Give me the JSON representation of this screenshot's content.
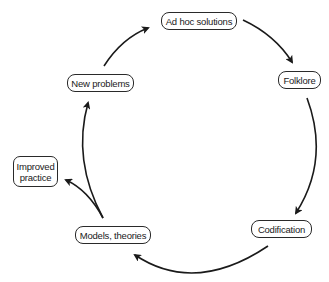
{
  "diagram": {
    "type": "cycle",
    "nodes": {
      "ad_hoc": {
        "label": "Ad hoc solutions"
      },
      "folklore": {
        "label": "Folklore"
      },
      "codification": {
        "label": "Codification"
      },
      "models": {
        "label": "Models, theories"
      },
      "new_problems": {
        "label": "New problems"
      },
      "improved": {
        "line1": "Improved",
        "line2": "practice"
      }
    },
    "edges": [
      {
        "from": "Ad hoc solutions",
        "to": "Folklore"
      },
      {
        "from": "Folklore",
        "to": "Codification"
      },
      {
        "from": "Codification",
        "to": "Models, theories"
      },
      {
        "from": "Models, theories",
        "to": "New problems"
      },
      {
        "from": "Models, theories",
        "to": "Improved practice"
      },
      {
        "from": "New problems",
        "to": "Ad hoc solutions"
      }
    ],
    "colors": {
      "stroke": "#1a1a1a",
      "background": "#ffffff"
    }
  }
}
